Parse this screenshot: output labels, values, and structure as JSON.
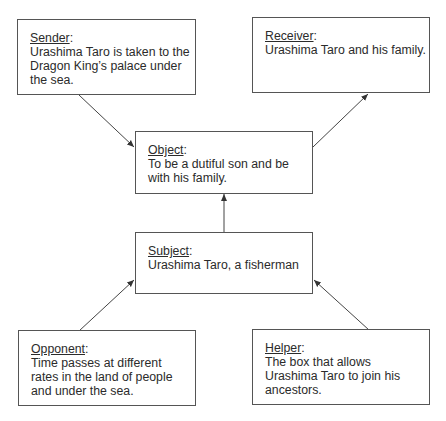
{
  "diagram": {
    "type": "actantial-model",
    "boxes": {
      "sender": {
        "label": "Sender",
        "text": "Urashima Taro is taken to the Dragon King’s palace under the sea."
      },
      "receiver": {
        "label": "Receiver",
        "text": "Urashima Taro and his family."
      },
      "object": {
        "label": "Object",
        "text": "To be a dutiful son and be with his family."
      },
      "subject": {
        "label": "Subject",
        "text": "Urashima Taro, a fisherman"
      },
      "opponent": {
        "label": "Opponent",
        "text": "Time passes at different rates in the land of people and under the sea."
      },
      "helper": {
        "label": "Helper",
        "text": "The box that allows Urashima Taro to join his ancestors."
      }
    },
    "edges": [
      {
        "from": "sender",
        "to": "object"
      },
      {
        "from": "object",
        "to": "receiver"
      },
      {
        "from": "subject",
        "to": "object"
      },
      {
        "from": "opponent",
        "to": "subject"
      },
      {
        "from": "helper",
        "to": "subject"
      }
    ],
    "colors": {
      "line": "#444444",
      "text": "#2b2b2b",
      "background": "#ffffff"
    }
  }
}
